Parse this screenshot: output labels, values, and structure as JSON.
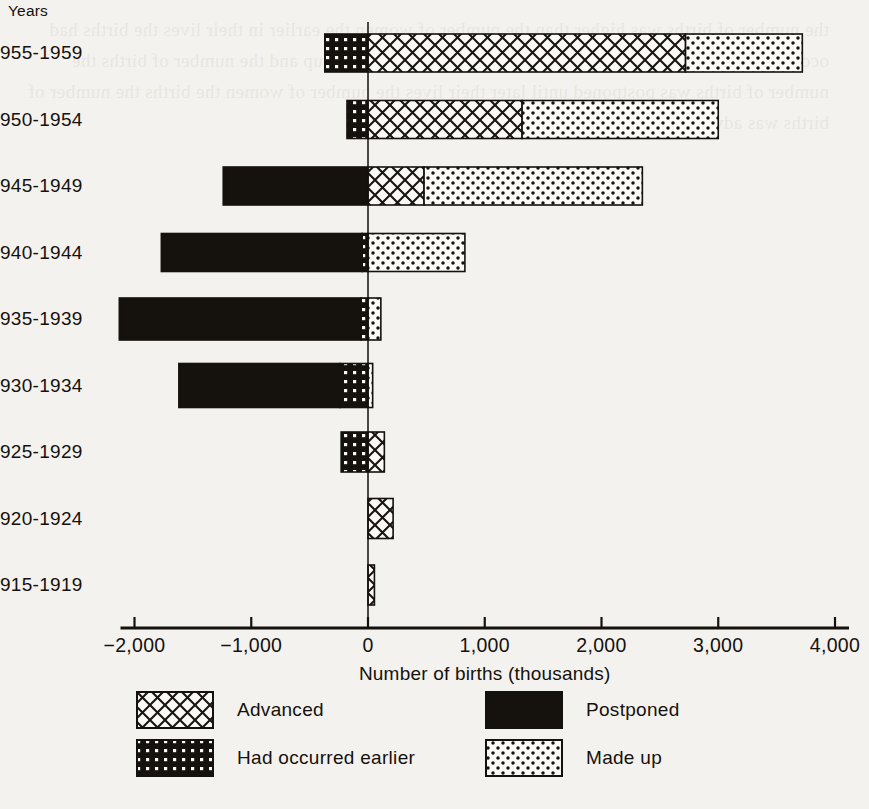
{
  "chart_data": {
    "type": "bar",
    "orientation": "horizontal",
    "stacked": true,
    "title": "",
    "xlabel": "Number of births (thousands)",
    "ylabel": "Years",
    "xlim": [
      -2000,
      4000
    ],
    "xticks": [
      -2000,
      -1000,
      0,
      1000,
      2000,
      3000,
      4000
    ],
    "xticklabels": [
      "−2,000",
      "−1,000",
      "0",
      "1,000",
      "2,000",
      "3,000",
      "4,000"
    ],
    "grid": false,
    "legend_position": "below-axis",
    "categories": [
      "1955-1959",
      "1950-1954",
      "1945-1949",
      "1940-1944",
      "1935-1939",
      "1930-1934",
      "1925-1929",
      "1920-1924",
      "1915-1919"
    ],
    "categories_visible": [
      "955-1959",
      "950-1954",
      "945-1949",
      "940-1944",
      "935-1939",
      "930-1934",
      "925-1929",
      "920-1924",
      "915-1919"
    ],
    "series": [
      {
        "name": "Postponed",
        "pattern": "solid-black",
        "color": "#15110d",
        "values": [
          0,
          0,
          -1240,
          -1720,
          -2070,
          -1380,
          0,
          0,
          0
        ]
      },
      {
        "name": "Had occurred earlier",
        "pattern": "dark-with-white-dots",
        "color": "#15110d",
        "values": [
          -370,
          -180,
          0,
          -50,
          -60,
          -240,
          -230,
          0,
          0
        ]
      },
      {
        "name": "Advanced",
        "pattern": "light-crosshatch",
        "color": "#ffffff",
        "values": [
          2720,
          1320,
          480,
          0,
          0,
          0,
          140,
          215,
          55
        ]
      },
      {
        "name": "Made up",
        "pattern": "white-with-black-dots",
        "color": "#ffffff",
        "values": [
          1000,
          1680,
          1870,
          830,
          110,
          40,
          0,
          0,
          0
        ]
      }
    ],
    "bar_totals_positive": [
      4000,
      3000,
      2350,
      830,
      110,
      40,
      140,
      215,
      55
    ],
    "bar_totals_negative": [
      -370,
      -180,
      -1240,
      -1770,
      -2130,
      -1620,
      -230,
      0,
      0
    ]
  },
  "legend": {
    "entries": [
      {
        "label": "Advanced",
        "pattern": "light-crosshatch"
      },
      {
        "label": "Postponed",
        "pattern": "solid-black"
      },
      {
        "label": "Had occurred earlier",
        "pattern": "dark-with-white-dots"
      },
      {
        "label": "Made up",
        "pattern": "white-with-black-dots"
      }
    ]
  },
  "ghost_text": "the number of births was higher than the number of women the earlier in their lives the births had occurred the number of women the number of births was made up and the number of births the number of births was postponed until later their lives the number of women the births the number of births was advanced"
}
